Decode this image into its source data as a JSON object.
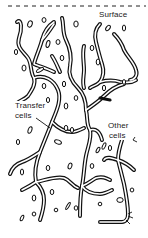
{
  "figure": {
    "type": "biological schematic",
    "surface_line": {
      "style": "dashed",
      "y": 6
    },
    "labels": {
      "surface": "Surface",
      "transfer_cells_line1": "Transfer",
      "transfer_cells_line2": "cells",
      "other_cells_line1": "Other",
      "other_cells_line2": "cells"
    },
    "colors": {
      "ink": "#111111",
      "background": "#ffffff"
    }
  }
}
